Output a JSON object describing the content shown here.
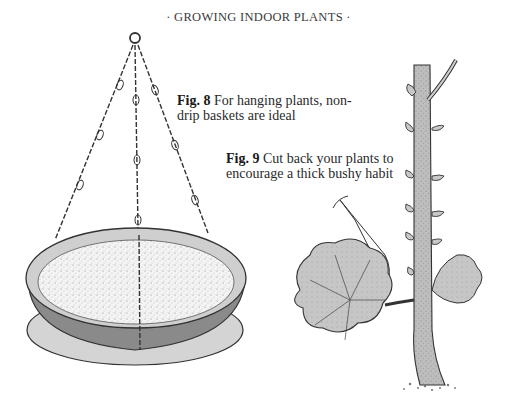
{
  "page": {
    "running_header": "· GROWING INDOOR PLANTS ·"
  },
  "figures": [
    {
      "label": "Fig. 8",
      "caption": "For hanging plants, non-drip baskets are ideal",
      "illustration": "hanging-basket-with-chains"
    },
    {
      "label": "Fig. 9",
      "caption": "Cut back your plants to encourage a thick bushy habit",
      "illustration": "pruning-stem-with-leaves"
    }
  ]
}
